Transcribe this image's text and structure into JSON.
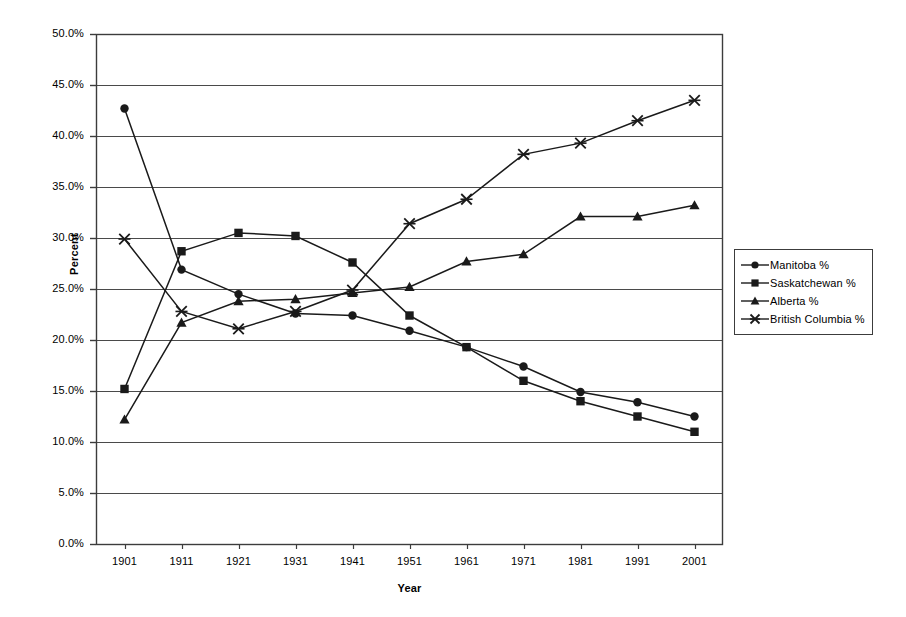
{
  "chart_data": {
    "type": "line",
    "title": "",
    "xlabel": "Year",
    "ylabel": "Percent",
    "categories": [
      "1901",
      "1911",
      "1921",
      "1931",
      "1941",
      "1951",
      "1961",
      "1971",
      "1981",
      "1991",
      "2001"
    ],
    "x": [
      1901,
      1911,
      1921,
      1931,
      1941,
      1951,
      1961,
      1971,
      1981,
      1991,
      2001
    ],
    "ylim": [
      0,
      50
    ],
    "ytick_labels": [
      "0.0%",
      "5.0%",
      "10.0%",
      "15.0%",
      "20.0%",
      "25.0%",
      "30.0%",
      "35.0%",
      "40.0%",
      "45.0%",
      "50.0%"
    ],
    "ytick_values": [
      0,
      5,
      10,
      15,
      20,
      25,
      30,
      35,
      40,
      45,
      50
    ],
    "grid": "horizontal",
    "legend_position": "right",
    "series": [
      {
        "name": "Manitoba %",
        "marker": "circle",
        "values": [
          42.7,
          26.9,
          24.5,
          22.6,
          22.4,
          20.9,
          19.3,
          17.4,
          14.9,
          13.9,
          12.5
        ]
      },
      {
        "name": "Saskatchewan %",
        "marker": "square",
        "values": [
          15.2,
          28.7,
          30.5,
          30.2,
          27.6,
          22.4,
          19.3,
          16.0,
          14.0,
          12.5,
          11.0
        ]
      },
      {
        "name": "Alberta %",
        "marker": "triangle",
        "values": [
          12.2,
          21.7,
          23.8,
          24.0,
          24.6,
          25.2,
          27.7,
          28.4,
          32.1,
          32.1,
          33.2
        ]
      },
      {
        "name": "British Columbia %",
        "marker": "cross",
        "values": [
          29.9,
          22.8,
          21.1,
          22.8,
          24.9,
          31.4,
          33.8,
          38.2,
          39.3,
          41.5,
          43.5
        ]
      }
    ]
  },
  "axes": {
    "y_title": "Percent",
    "x_title": "Year"
  },
  "legend": {
    "items": [
      {
        "label": "Manitoba %",
        "marker": "circle"
      },
      {
        "label": "Saskatchewan %",
        "marker": "square"
      },
      {
        "label": "Alberta %",
        "marker": "triangle"
      },
      {
        "label": "British Columbia %",
        "marker": "cross"
      }
    ]
  },
  "colors": {
    "series": "#1a1a1a",
    "grid": "#4a4a4a",
    "axis": "#3c3c3c",
    "background": "#ffffff"
  }
}
